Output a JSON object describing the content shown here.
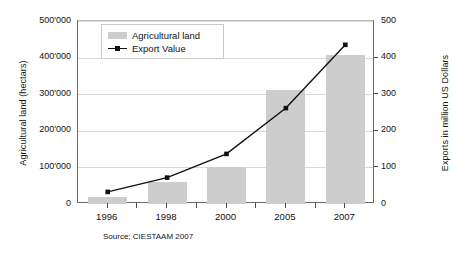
{
  "chart_data": {
    "type": "bar",
    "title": "",
    "subtitle": "",
    "categories": [
      "1996",
      "1998",
      "2000",
      "2005",
      "2007"
    ],
    "series": [
      {
        "name": "Agricultural land",
        "type": "bar",
        "axis": "left",
        "unit": "hectars",
        "color": "#cdcdcd",
        "values": [
          20000,
          60000,
          102000,
          312000,
          407000
        ]
      },
      {
        "name": "Export Value",
        "type": "line",
        "axis": "right",
        "unit": "million US Dollars",
        "color": "#111111",
        "values": [
          33,
          72,
          137,
          262,
          435
        ]
      }
    ],
    "xlabel": "",
    "ylabel": "Agricultural land (hectars)",
    "y2label": "Exports in million US Dollars",
    "ylim": [
      0,
      500000
    ],
    "y2lim": [
      0,
      500
    ],
    "yticks": [
      "0",
      "100'000",
      "200'000",
      "300'000",
      "400'000",
      "500'000"
    ],
    "ytick_values": [
      0,
      100000,
      200000,
      300000,
      400000,
      500000
    ],
    "y2ticks": [
      "0",
      "100",
      "200",
      "300",
      "400",
      "500"
    ],
    "y2tick_values": [
      0,
      100,
      200,
      300,
      400,
      500
    ],
    "grid": true,
    "legend_position": "top-left",
    "source_note": "Source; CIESTAAM 2007"
  },
  "legend": {
    "items": [
      {
        "label": "Agricultural land",
        "marker": "bar-swatch"
      },
      {
        "label": "Export Value",
        "marker": "line-marker"
      }
    ]
  },
  "icons": {
    "bar_swatch": "bar-swatch-icon",
    "line_swatch": "line-marker-icon"
  }
}
